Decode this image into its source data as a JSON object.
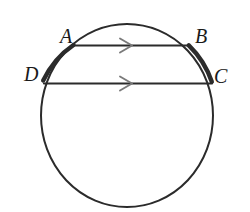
{
  "figure": {
    "background_color": "#ffffff",
    "stroke_color": "#2b2b2b",
    "arrow_color": "#6b6b6b",
    "label_color": "#1a1a1a",
    "circle": {
      "center_x": 127,
      "center_y": 115.5,
      "radius_x": 86,
      "radius_y": 91.5,
      "stroke_width": 2.0
    },
    "highlight_arcs": [
      {
        "name": "arc-A-D",
        "from": "A",
        "to": "D",
        "stroke_width": 4.2
      },
      {
        "name": "arc-B-C",
        "from": "B",
        "to": "C",
        "stroke_width": 4.2
      }
    ],
    "chords": [
      {
        "name": "chord-AB",
        "from": "A",
        "to": "B",
        "x1": 73,
        "y1": 45.5,
        "x2": 189,
        "y2": 45.5,
        "stroke_width": 2.2,
        "tick_marks": 1
      },
      {
        "name": "chord-DC",
        "from": "D",
        "to": "C",
        "x1": 44,
        "y1": 83.5,
        "x2": 212,
        "y2": 83.5,
        "stroke_width": 2.2,
        "tick_marks": 1
      }
    ],
    "arrow_marks": [
      {
        "name": "arrow-mark-chord-AB",
        "on_chord": "chord-AB",
        "x": 127,
        "y": 45.5,
        "direction": "right"
      },
      {
        "name": "arrow-mark-chord-DC",
        "on_chord": "chord-DC",
        "x": 127,
        "y": 83.5,
        "direction": "right"
      }
    ],
    "points": [
      {
        "id": "A",
        "label": "A",
        "x": 73,
        "y": 45.5
      },
      {
        "id": "B",
        "label": "B",
        "x": 189,
        "y": 45.5
      },
      {
        "id": "C",
        "label": "C",
        "x": 212,
        "y": 83.5
      },
      {
        "id": "D",
        "label": "D",
        "x": 44,
        "y": 83.5
      }
    ]
  },
  "labels": {
    "A": "A",
    "B": "B",
    "C": "C",
    "D": "D"
  }
}
